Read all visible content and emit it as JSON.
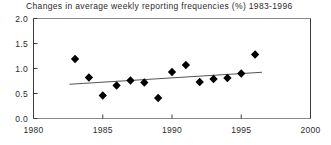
{
  "chart_data": {
    "type": "scatter",
    "title": "Changes in average weekly reporting frequencies (%) 1983-1996",
    "xlabel": "",
    "ylabel": "",
    "xlim": [
      1980,
      2000
    ],
    "ylim": [
      0.0,
      2.0
    ],
    "xticks": [
      1980,
      1985,
      1990,
      1995,
      2000
    ],
    "xtick_labels": [
      "1980",
      "1985",
      "1990",
      "1995",
      "2000"
    ],
    "yticks": [
      0.0,
      0.5,
      1.0,
      1.5,
      2.0
    ],
    "ytick_labels": [
      "0.0",
      "0.5",
      "1.0",
      "1.5",
      "2.0"
    ],
    "grid": false,
    "legend": "none",
    "marker": "filled-diamond",
    "marker_color": "#000000",
    "series": [
      {
        "name": "Average weekly reporting frequency change",
        "x": [
          1983,
          1984,
          1985,
          1986,
          1987,
          1988,
          1989,
          1990,
          1991,
          1992,
          1993,
          1994,
          1995,
          1996
        ],
        "y": [
          1.19,
          0.82,
          0.46,
          0.66,
          0.76,
          0.72,
          0.41,
          0.93,
          1.07,
          0.73,
          0.79,
          0.81,
          0.9,
          1.28
        ]
      }
    ],
    "trendline": {
      "name": "linear-fit",
      "color": "#555555",
      "x": [
        1982.6,
        1996.5
      ],
      "y": [
        0.685,
        0.925
      ]
    }
  },
  "axes": {
    "x_axis_name": "year-axis",
    "y_axis_name": "percent-axis"
  }
}
